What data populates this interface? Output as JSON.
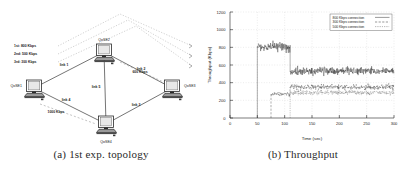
{
  "figure": {
    "panel_a": {
      "caption": "(a)  1st exp. topology"
    },
    "panel_b": {
      "caption": "(b)  Throughput"
    }
  },
  "topology": {
    "nodes": [
      {
        "id": "left",
        "label": "QoSE1",
        "x": 34,
        "y": 88
      },
      {
        "id": "top",
        "label": "QoSE2",
        "x": 104,
        "y": 52
      },
      {
        "id": "right",
        "label": "QoSE3",
        "x": 172,
        "y": 88
      },
      {
        "id": "bottom",
        "label": "QoSE4",
        "x": 106,
        "y": 124
      }
    ],
    "links": [
      {
        "label": "link 1",
        "x": 64,
        "y": 66
      },
      {
        "label": "link 2",
        "x": 141,
        "y": 70
      },
      {
        "label": "link 3",
        "x": 136,
        "y": 106
      },
      {
        "label": "link 4",
        "x": 66,
        "y": 101
      },
      {
        "label": "link 5",
        "x": 96,
        "y": 88
      }
    ],
    "capacities": [
      {
        "label": "1000 Kbps",
        "x": 56,
        "y": 113
      },
      {
        "label": "600 Kbps",
        "x": 140,
        "y": 73
      }
    ],
    "flows": [
      {
        "label": "1st: 800 Kbps",
        "x": 14,
        "y": 47
      },
      {
        "label": "2nd: 500 Kbps",
        "x": 14,
        "y": 55
      },
      {
        "label": "3rd: 300 Kbps",
        "x": 14,
        "y": 63
      }
    ]
  },
  "chart_data": {
    "type": "line",
    "title": "",
    "xlabel": "Time (sec)",
    "ylabel": "Throughput (Kbps)",
    "xlim": [
      0,
      300
    ],
    "ylim": [
      0,
      1200
    ],
    "xticks": [
      0,
      50,
      100,
      150,
      200,
      250,
      300
    ],
    "yticks": [
      0,
      200,
      400,
      600,
      800,
      1000,
      1200
    ],
    "grid": true,
    "legend_position": "top-right",
    "series": [
      {
        "name": "800 Kbps connection",
        "style": "solid",
        "start_time": 50,
        "segments": [
          {
            "from": 50,
            "to": 110,
            "mean": 800,
            "noise": 60
          },
          {
            "from": 110,
            "to": 300,
            "mean": 530,
            "noise": 45
          }
        ]
      },
      {
        "name": "300 Kbps connection",
        "style": "dashed",
        "start_time": 75,
        "segments": [
          {
            "from": 75,
            "to": 110,
            "mean": 270,
            "noise": 25
          },
          {
            "from": 110,
            "to": 300,
            "mean": 350,
            "noise": 35
          }
        ]
      },
      {
        "name": "500 Kbps connection",
        "style": "dotted",
        "start_time": 110,
        "segments": [
          {
            "from": 110,
            "to": 300,
            "mean": 288,
            "noise": 28
          }
        ]
      }
    ]
  }
}
